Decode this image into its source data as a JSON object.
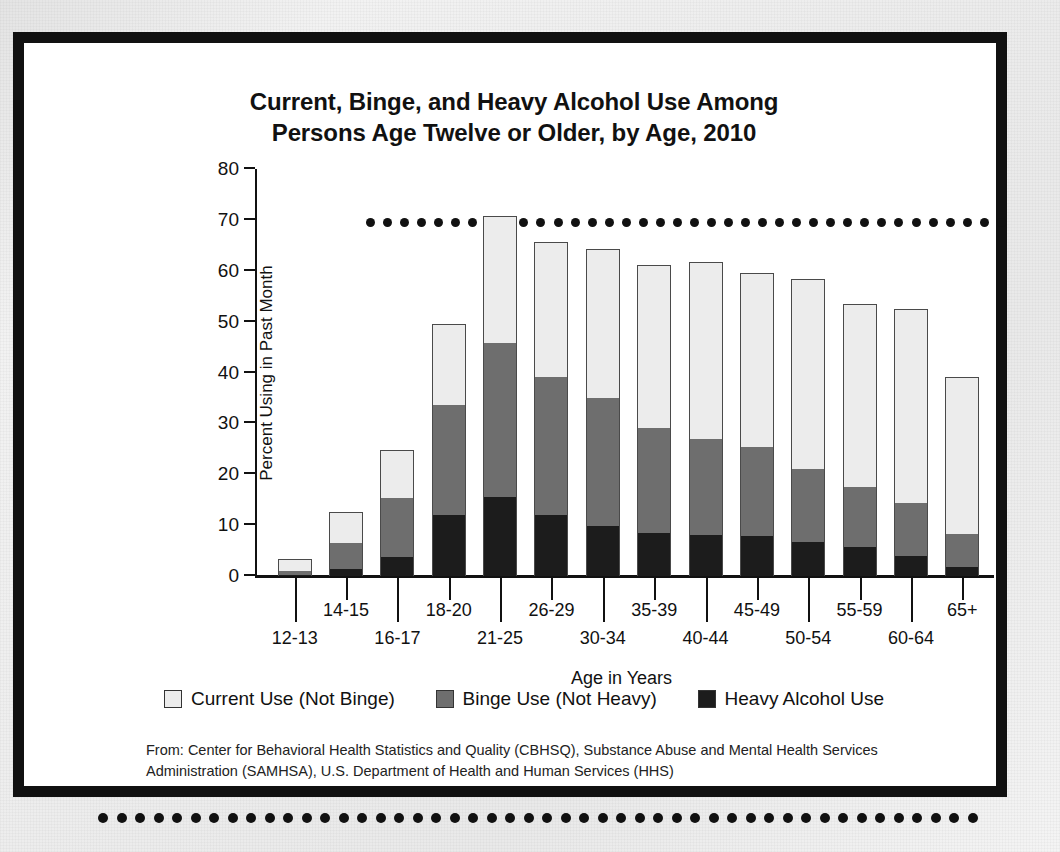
{
  "slide": {
    "title_line1": "Current, Binge, and Heavy Alcohol Use Among",
    "title_line2": "Persons Age Twelve or Older, by Age, 2010",
    "footer_line1": "From: Center for Behavioral Health Statistics and Quality (CBHSQ), Substance Abuse and Mental Health",
    "footer_line2": "Services Administration (SAMHSA), U.S. Department of Health and Human Services (HHS)",
    "decor_top_dots": 38,
    "decor_bottom_dots": 48
  },
  "legend": {
    "items": [
      {
        "label": "Current Use (Not Binge)",
        "color": "#ececec",
        "key": "current"
      },
      {
        "label": "Binge Use (Not Heavy)",
        "color": "#6e6e6e",
        "key": "binge"
      },
      {
        "label": "Heavy Alcohol Use",
        "color": "#1c1c1c",
        "key": "heavy"
      }
    ]
  },
  "chart_data": {
    "type": "bar",
    "stacked": true,
    "title": "Current, Binge, and Heavy Alcohol Use Among Persons Age Twelve or Older, by Age, 2010",
    "xlabel": "Age in Years",
    "ylabel": "Percent Using in Past Month",
    "ylim": [
      0,
      80
    ],
    "yticks": [
      0,
      10,
      20,
      30,
      40,
      50,
      60,
      70,
      80
    ],
    "grid": false,
    "legend_position": "bottom",
    "categories": [
      "12-13",
      "14-15",
      "16-17",
      "18-20",
      "21-25",
      "26-29",
      "30-34",
      "35-39",
      "40-44",
      "45-49",
      "50-54",
      "55-59",
      "60-64",
      "65+"
    ],
    "totals": [
      3.1,
      12.4,
      24.6,
      49.3,
      70.5,
      65.4,
      64.1,
      60.9,
      61.6,
      59.4,
      58.2,
      53.3,
      52.2,
      38.9
    ],
    "series": [
      {
        "name": "Heavy Alcohol Use",
        "color": "#1c1c1c",
        "values": [
          0.2,
          1.4,
          3.8,
          11.9,
          15.5,
          12.0,
          9.8,
          8.5,
          8.0,
          7.8,
          6.6,
          5.8,
          4.0,
          1.8
        ]
      },
      {
        "name": "Binge Use (Not Heavy)",
        "color": "#6e6e6e",
        "values": [
          0.7,
          5.1,
          11.5,
          21.8,
          30.4,
          27.1,
          25.2,
          20.5,
          18.9,
          17.6,
          14.5,
          11.7,
          10.3,
          6.5
        ]
      },
      {
        "name": "Current Use (Not Binge)",
        "color": "#ececec",
        "values": [
          2.2,
          5.9,
          9.3,
          15.6,
          24.6,
          26.3,
          29.1,
          31.9,
          34.7,
          34.0,
          37.1,
          35.8,
          37.9,
          30.6
        ]
      }
    ],
    "cumulative_tops": {
      "heavy": [
        0.2,
        1.4,
        3.8,
        11.9,
        15.5,
        12.0,
        9.8,
        8.5,
        8.0,
        7.8,
        6.6,
        5.8,
        4.0,
        1.8
      ],
      "binge": [
        0.9,
        6.5,
        15.3,
        33.7,
        45.9,
        39.1,
        35.0,
        29.0,
        26.9,
        25.4,
        21.1,
        17.5,
        14.3,
        8.3
      ],
      "current": [
        3.1,
        12.4,
        24.6,
        49.3,
        70.5,
        65.4,
        64.1,
        60.9,
        61.6,
        59.4,
        58.2,
        53.3,
        52.2,
        38.9
      ]
    }
  }
}
